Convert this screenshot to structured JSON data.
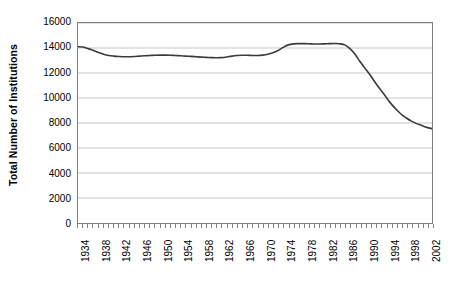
{
  "chart_data": {
    "type": "line",
    "title": "",
    "subtitle": "",
    "xlabel": "",
    "ylabel": "Total Number of Institutions",
    "ylim": [
      0,
      16000
    ],
    "ytick_labels": [
      "0",
      "2000",
      "4000",
      "6000",
      "8000",
      "10000",
      "12000",
      "14000",
      "16000"
    ],
    "ytick_values": [
      0,
      2000,
      4000,
      6000,
      8000,
      10000,
      12000,
      14000,
      16000
    ],
    "xlim": [
      1934,
      2003
    ],
    "xtick_labels": [
      "1934",
      "1938",
      "1942",
      "1946",
      "1950",
      "1954",
      "1958",
      "1962",
      "1966",
      "1970",
      "1974",
      "1978",
      "1982",
      "1986",
      "1990",
      "1994",
      "1998",
      "2002"
    ],
    "xtick_values": [
      1934,
      1938,
      1942,
      1946,
      1950,
      1954,
      1958,
      1962,
      1966,
      1970,
      1974,
      1978,
      1982,
      1986,
      1990,
      1994,
      1998,
      2002
    ],
    "grid": "horizontal",
    "legend": "none",
    "line_color": "#3a3a3a",
    "grid_color": "#c8c8c8",
    "axis_color": "#808080",
    "series": [
      {
        "name": "Total Number of Institutions",
        "x": [
          1934,
          1935,
          1936,
          1937,
          1938,
          1939,
          1940,
          1941,
          1942,
          1943,
          1944,
          1945,
          1946,
          1947,
          1948,
          1949,
          1950,
          1951,
          1952,
          1953,
          1954,
          1955,
          1956,
          1957,
          1958,
          1959,
          1960,
          1961,
          1962,
          1963,
          1964,
          1965,
          1966,
          1967,
          1968,
          1969,
          1970,
          1971,
          1972,
          1973,
          1974,
          1975,
          1976,
          1977,
          1978,
          1979,
          1980,
          1981,
          1982,
          1983,
          1984,
          1985,
          1986,
          1987,
          1988,
          1989,
          1990,
          1991,
          1992,
          1993,
          1994,
          1995,
          1996,
          1997,
          1998,
          1999,
          2000,
          2001,
          2002,
          2003
        ],
        "values": [
          14100,
          14080,
          13950,
          13800,
          13650,
          13500,
          13400,
          13350,
          13320,
          13300,
          13300,
          13320,
          13350,
          13380,
          13400,
          13420,
          13430,
          13430,
          13420,
          13400,
          13380,
          13350,
          13330,
          13300,
          13270,
          13250,
          13230,
          13220,
          13230,
          13280,
          13350,
          13400,
          13420,
          13420,
          13400,
          13400,
          13430,
          13500,
          13620,
          13800,
          14050,
          14250,
          14330,
          14350,
          14350,
          14340,
          14320,
          14320,
          14330,
          14350,
          14360,
          14340,
          14250,
          13950,
          13500,
          12900,
          12350,
          11800,
          11200,
          10650,
          10100,
          9550,
          9100,
          8700,
          8400,
          8150,
          7950,
          7800,
          7650,
          7550
        ]
      }
    ]
  }
}
